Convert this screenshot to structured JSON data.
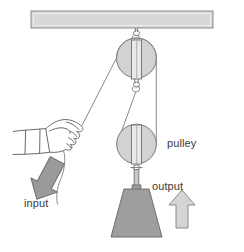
{
  "diagram": {
    "type": "mechanical-advantage-pulley",
    "background_color": "#ffffff",
    "labels": {
      "pulley": "pulley",
      "input": "input",
      "output": "output"
    },
    "colors": {
      "outline": "#6b6b6b",
      "beam_fill": "#d8d8d8",
      "beam_stroke": "#8a8a8a",
      "pulley_fill": "#d2d2d2",
      "pulley_stroke": "#7a7a7a",
      "weight_fill": "#9e9e9e",
      "weight_stroke": "#6e6e6e",
      "input_arrow_fill": "#9a9a9a",
      "input_arrow_stroke": "#6e6e6e",
      "output_arrow_fill": "#d5d5d5",
      "output_arrow_stroke": "#8a8a8a",
      "rope_stroke": "#8a8a8a",
      "hand_stroke": "#6b6b6b",
      "text": "#3a3a3a"
    },
    "parts": {
      "ceiling_beam": "ceiling-beam",
      "top_pulley": "fixed-pulley",
      "bottom_pulley": "movable-pulley",
      "weight": "load-weight",
      "hand": "hand-pulling-rope",
      "rope": "rope"
    }
  }
}
